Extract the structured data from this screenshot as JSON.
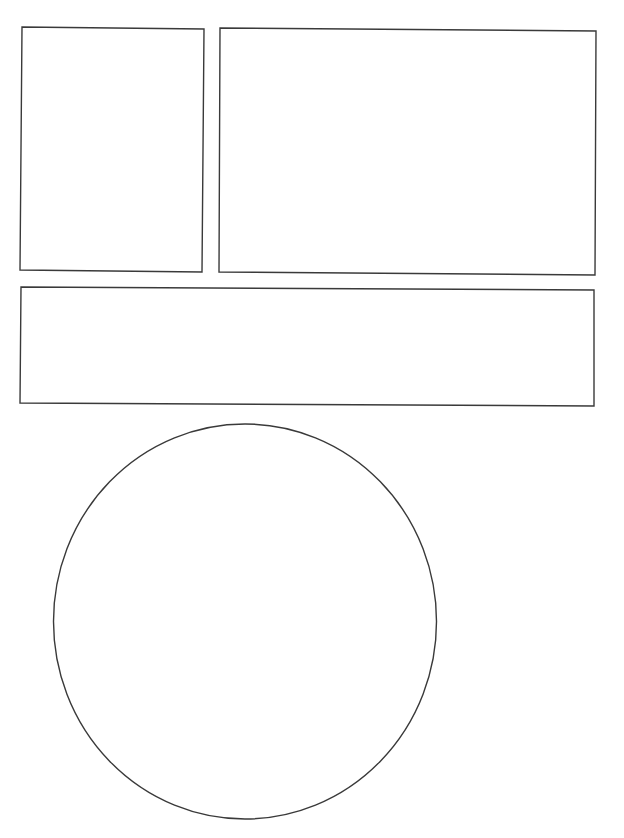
{
  "page": {
    "width": 624,
    "height": 838,
    "background": "#ffffff",
    "stroke_color": "#3a3a3a"
  },
  "panels": [
    {
      "id": "panel-top-left",
      "shape": "rect",
      "points": "22,27 204,29 202,272 20,270"
    },
    {
      "id": "panel-top-right",
      "shape": "rect",
      "points": "220,28 596,31 595,275 219,272"
    },
    {
      "id": "panel-wide-middle",
      "shape": "rect",
      "points": "21,287 594,290 594,406 20,403"
    },
    {
      "id": "panel-circle",
      "shape": "ellipse",
      "cx": 245,
      "cy": 621.5,
      "rx": 191.5,
      "ry": 197.5
    }
  ]
}
